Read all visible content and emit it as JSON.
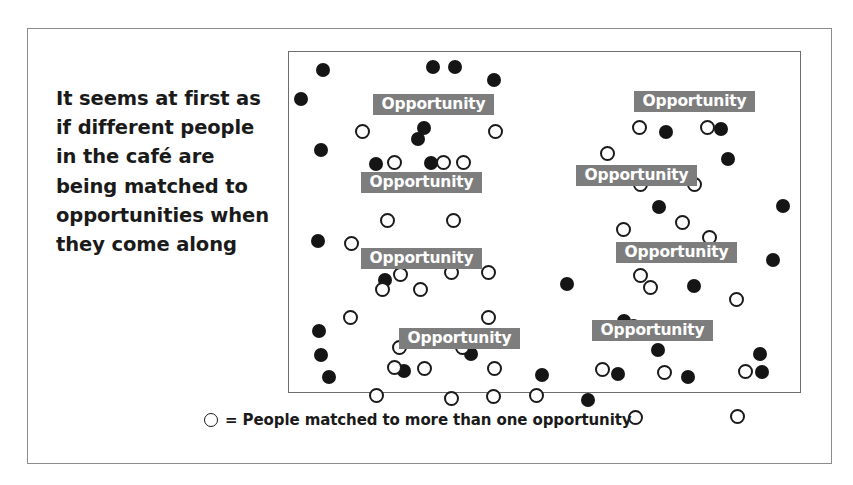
{
  "figure": {
    "caption_text": "It seems at first as if different people in the café are being matched to opportunities when they come along",
    "legend": {
      "symbol": "hollow-circle",
      "text": "= People matched to more than one opportunity"
    },
    "colors": {
      "dot_filled": "#151515",
      "dot_hollow_fill": "#ffffff",
      "dot_hollow_stroke": "#1a1a1a",
      "label_background": "#7d7d7d",
      "label_text": "#ffffff",
      "outer_frame": "#8c8c8c",
      "inner_frame": "#6e6e6e",
      "page_background": "#ffffff",
      "text": "#1a1a1a"
    },
    "opportunity_label": "Opportunity",
    "opportunity_labels": [
      {
        "text": "Opportunity",
        "x": 84,
        "y": 42,
        "width": 121
      },
      {
        "text": "Opportunity",
        "x": 72,
        "y": 120,
        "width": 121
      },
      {
        "text": "Opportunity",
        "x": 72,
        "y": 196,
        "width": 121
      },
      {
        "text": "Opportunity",
        "x": 110,
        "y": 276,
        "width": 121
      },
      {
        "text": "Opportunity",
        "x": 345,
        "y": 39,
        "width": 121
      },
      {
        "text": "Opportunity",
        "x": 287,
        "y": 113,
        "width": 121
      },
      {
        "text": "Opportunity",
        "x": 327,
        "y": 190,
        "width": 121
      },
      {
        "text": "Opportunity",
        "x": 303,
        "y": 268,
        "width": 121
      }
    ],
    "dots_filled": [
      {
        "x": 27,
        "y": 11
      },
      {
        "x": 5,
        "y": 40
      },
      {
        "x": 137,
        "y": 8
      },
      {
        "x": 198,
        "y": 21
      },
      {
        "x": 25,
        "y": 91
      },
      {
        "x": 122,
        "y": 80
      },
      {
        "x": 80,
        "y": 105
      },
      {
        "x": 135,
        "y": 104
      },
      {
        "x": 94,
        "y": 200
      },
      {
        "x": 159,
        "y": 8
      },
      {
        "x": 22,
        "y": 182
      },
      {
        "x": 23,
        "y": 272
      },
      {
        "x": 108,
        "y": 312
      },
      {
        "x": 175,
        "y": 295
      },
      {
        "x": 110,
        "y": 276
      },
      {
        "x": 128,
        "y": 69
      },
      {
        "x": 370,
        "y": 73
      },
      {
        "x": 425,
        "y": 70
      },
      {
        "x": 432,
        "y": 100
      },
      {
        "x": 363,
        "y": 148
      },
      {
        "x": 487,
        "y": 147
      },
      {
        "x": 33,
        "y": 318
      },
      {
        "x": 477,
        "y": 201
      },
      {
        "x": 89,
        "y": 221
      },
      {
        "x": 271,
        "y": 225
      },
      {
        "x": 398,
        "y": 227
      },
      {
        "x": 328,
        "y": 262
      },
      {
        "x": 25,
        "y": 296
      },
      {
        "x": 464,
        "y": 295
      },
      {
        "x": 322,
        "y": 315
      },
      {
        "x": 392,
        "y": 318
      },
      {
        "x": 246,
        "y": 316
      },
      {
        "x": 466,
        "y": 313
      },
      {
        "x": 362,
        "y": 291
      },
      {
        "x": 292,
        "y": 341
      }
    ],
    "dots_hollow": [
      {
        "x": 101,
        "y": 45
      },
      {
        "x": 161,
        "y": 44
      },
      {
        "x": 66,
        "y": 72
      },
      {
        "x": 199,
        "y": 72
      },
      {
        "x": 98,
        "y": 103
      },
      {
        "x": 147,
        "y": 103
      },
      {
        "x": 167,
        "y": 103
      },
      {
        "x": 91,
        "y": 161
      },
      {
        "x": 157,
        "y": 161
      },
      {
        "x": 55,
        "y": 184
      },
      {
        "x": 104,
        "y": 215
      },
      {
        "x": 155,
        "y": 213
      },
      {
        "x": 192,
        "y": 213
      },
      {
        "x": 86,
        "y": 230
      },
      {
        "x": 124,
        "y": 230
      },
      {
        "x": 54,
        "y": 258
      },
      {
        "x": 192,
        "y": 258
      },
      {
        "x": 103,
        "y": 288
      },
      {
        "x": 166,
        "y": 288
      },
      {
        "x": 128,
        "y": 309
      },
      {
        "x": 198,
        "y": 309
      },
      {
        "x": 80,
        "y": 336
      },
      {
        "x": 155,
        "y": 339
      },
      {
        "x": 197,
        "y": 337
      },
      {
        "x": 240,
        "y": 336
      },
      {
        "x": 98,
        "y": 308
      },
      {
        "x": 343,
        "y": 68
      },
      {
        "x": 411,
        "y": 68
      },
      {
        "x": 311,
        "y": 94
      },
      {
        "x": 344,
        "y": 125
      },
      {
        "x": 398,
        "y": 125
      },
      {
        "x": 327,
        "y": 170
      },
      {
        "x": 386,
        "y": 163
      },
      {
        "x": 413,
        "y": 178
      },
      {
        "x": 344,
        "y": 216
      },
      {
        "x": 354,
        "y": 228
      },
      {
        "x": 440,
        "y": 240
      },
      {
        "x": 337,
        "y": 267
      },
      {
        "x": 405,
        "y": 270
      },
      {
        "x": 306,
        "y": 310
      },
      {
        "x": 368,
        "y": 313
      },
      {
        "x": 449,
        "y": 312
      },
      {
        "x": 339,
        "y": 358
      },
      {
        "x": 441,
        "y": 357
      }
    ]
  }
}
